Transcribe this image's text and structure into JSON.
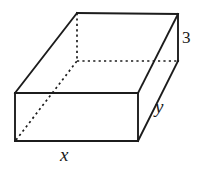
{
  "figure": {
    "name": "rectangular-prism",
    "shape_type": "rectangular prism",
    "background_color": "#ffffff",
    "line_color": "#1c1c1c",
    "hidden_line_style": "dotted"
  },
  "labels": {
    "height": "3",
    "depth": "y",
    "width": "x"
  },
  "geometry": {
    "top_back_left": {
      "x": 77,
      "y": 13
    },
    "top_back_right": {
      "x": 178,
      "y": 14
    },
    "top_front_right": {
      "x": 138,
      "y": 93
    },
    "top_front_left": {
      "x": 15,
      "y": 93
    },
    "bottom_front_left": {
      "x": 15,
      "y": 141
    },
    "bottom_front_right": {
      "x": 138,
      "y": 141
    },
    "bottom_back_left": {
      "x": 77,
      "y": 61
    },
    "bottom_back_right": {
      "x": 178,
      "y": 61
    },
    "visible_edges": [
      "top-back-left to top-back-right",
      "top-back-right to top-front-right",
      "top-front-right to top-front-left",
      "top-front-left to top-back-left",
      "top-front-left to bottom-front-left",
      "top-front-right to bottom-front-right",
      "bottom-front-left to bottom-front-right",
      "top-back-right to bottom-back-right"
    ],
    "hidden_edges": [
      "top-back-left to bottom-back-left",
      "bottom-back-left to bottom-back-right",
      "bottom-front-left to bottom-back-left"
    ]
  }
}
